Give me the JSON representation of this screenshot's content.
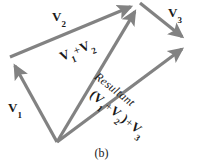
{
  "figure": {
    "caption": "(b)",
    "stroke_color": "#828282",
    "text_color": "#1a1a1a",
    "background_color": "#ffffff",
    "stroke_width": 3.2,
    "width": 203,
    "height": 167
  },
  "labels": {
    "v1": {
      "symbol": "V",
      "subscript": "1"
    },
    "v2": {
      "symbol": "V",
      "subscript": "2"
    },
    "v3": {
      "symbol": "V",
      "subscript": "3"
    },
    "sum12": {
      "v_a": "V",
      "sub_a": "1",
      "operator": "+",
      "v_b": "V",
      "sub_b": "2"
    },
    "resultant": {
      "text": "Resultant"
    },
    "sum123": {
      "open_paren": "(",
      "v_a": "V",
      "sub_a": "1",
      "operator_inner": "+",
      "v_b": "V",
      "sub_b": "2",
      "close_paren": ")",
      "operator_outer": "+",
      "v_c": "V",
      "sub_c": "3"
    }
  },
  "chart_data": {
    "type": "diagram",
    "subtype": "vector-addition-head-to-tail",
    "title": "(b)",
    "coordinate_space": {
      "width": 203,
      "height": 167,
      "origin": "top-left"
    },
    "points": {
      "O": {
        "x": 57,
        "y": 142,
        "role": "common tail / origin"
      },
      "A": {
        "x": 10,
        "y": 57,
        "role": "tip of V1 / tail of V2"
      },
      "B": {
        "x": 140,
        "y": 3,
        "role": "tip of V2 / tip of V1+V2 / tail of V3"
      },
      "C": {
        "x": 190,
        "y": 43,
        "role": "tip of V3 / tip of Resultant"
      }
    },
    "vectors": [
      {
        "name": "V1",
        "from": "O",
        "to": "A",
        "x1": 57,
        "y1": 142,
        "x2": 10,
        "y2": 57,
        "arrow": "end",
        "label": "V1"
      },
      {
        "name": "V2",
        "from": "A",
        "to": "B",
        "x1": 10,
        "y1": 57,
        "x2": 140,
        "y2": 3,
        "arrow": "end",
        "label": "V2"
      },
      {
        "name": "V1+V2",
        "from": "O",
        "to": "B",
        "x1": 57,
        "y1": 142,
        "x2": 140,
        "y2": 3,
        "arrow": "end",
        "label": "V1 + V2"
      },
      {
        "name": "V3",
        "from": "B",
        "to": "C",
        "x1": 140,
        "y1": 3,
        "x2": 190,
        "y2": 43,
        "arrow": "end",
        "label": "V3"
      },
      {
        "name": "Resultant",
        "from": "O",
        "to": "C",
        "x1": 57,
        "y1": 142,
        "x2": 190,
        "y2": 43,
        "arrow": "end",
        "label": "Resultant (V1 + V2) + V3"
      }
    ],
    "annotations": [
      "V2",
      "V3",
      "V1",
      "V1 + V2",
      "Resultant",
      "(V1 + V2) + V3",
      "(b)"
    ],
    "grid": false,
    "legend": "none"
  }
}
